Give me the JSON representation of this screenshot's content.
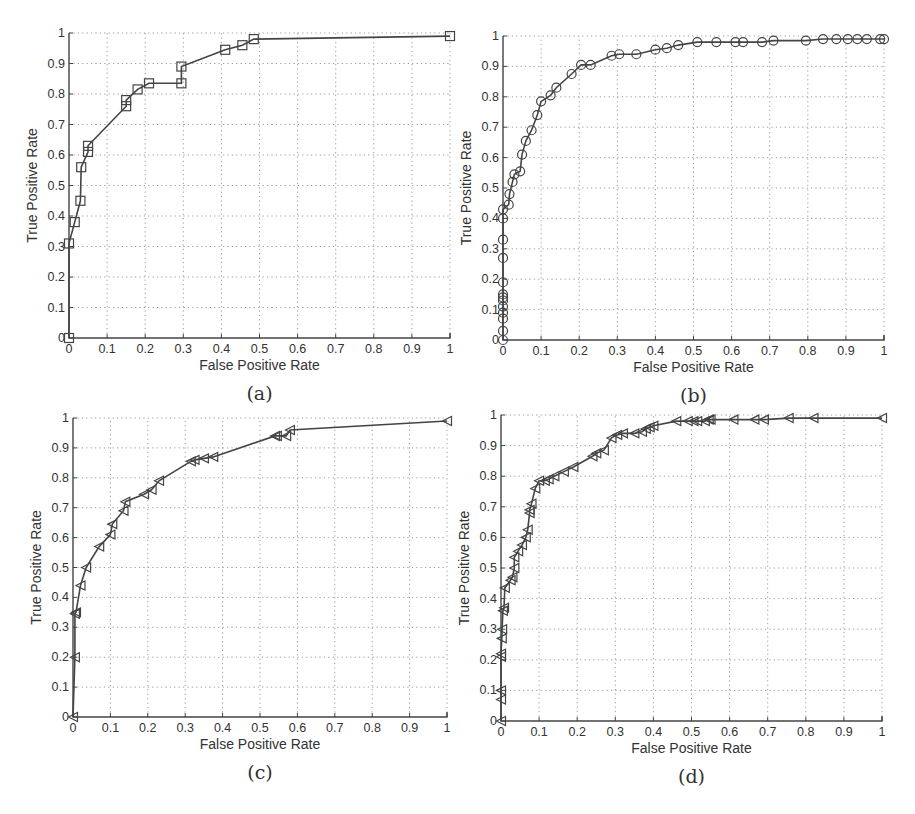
{
  "figure": {
    "panels": [
      {
        "id": "a",
        "caption": "(a)",
        "marker": "square"
      },
      {
        "id": "b",
        "caption": "(b)",
        "marker": "circle"
      },
      {
        "id": "c",
        "caption": "(c)",
        "marker": "triangle-left"
      },
      {
        "id": "d",
        "caption": "(d)",
        "marker": "triangle-left"
      }
    ],
    "xlabel": "False Positive Rate",
    "ylabel": "True Positive Rate",
    "xticks": [
      "0",
      "0.1",
      "0.2",
      "0.3",
      "0.4",
      "0.5",
      "0.6",
      "0.7",
      "0.8",
      "0.9",
      "1"
    ],
    "yticks": [
      "0",
      "0.1",
      "0.2",
      "0.3",
      "0.4",
      "0.5",
      "0.6",
      "0.7",
      "0.8",
      "0.9",
      "1"
    ],
    "line_color": "#444444",
    "grid_color": "#9a9a9a"
  },
  "chart_data": [
    {
      "type": "line",
      "panel": "(a)",
      "title": "",
      "xlabel": "False Positive Rate",
      "ylabel": "True Positive Rate",
      "xlim": [
        0,
        1
      ],
      "ylim": [
        0,
        1
      ],
      "grid": true,
      "marker": "square",
      "x": [
        0,
        0,
        0.015,
        0.03,
        0.032,
        0.05,
        0.05,
        0.15,
        0.15,
        0.18,
        0.21,
        0.295,
        0.295,
        0.41,
        0.455,
        0.485,
        1.0
      ],
      "y": [
        0,
        0.31,
        0.38,
        0.45,
        0.56,
        0.61,
        0.63,
        0.76,
        0.78,
        0.815,
        0.835,
        0.835,
        0.89,
        0.945,
        0.96,
        0.98,
        0.99
      ]
    },
    {
      "type": "line",
      "panel": "(b)",
      "title": "",
      "xlabel": "False Positive Rate",
      "ylabel": "True Positive Rate",
      "xlim": [
        0,
        1
      ],
      "ylim": [
        0,
        1
      ],
      "grid": true,
      "marker": "circle",
      "x": [
        0,
        0,
        0,
        0,
        0,
        0,
        0,
        0,
        0,
        0,
        0,
        0,
        0,
        0.015,
        0.017,
        0.025,
        0.03,
        0.045,
        0.05,
        0.06,
        0.075,
        0.09,
        0.1,
        0.125,
        0.14,
        0.18,
        0.205,
        0.23,
        0.285,
        0.305,
        0.35,
        0.4,
        0.43,
        0.46,
        0.51,
        0.56,
        0.61,
        0.63,
        0.68,
        0.71,
        0.795,
        0.84,
        0.875,
        0.905,
        0.93,
        0.955,
        0.99,
        1.0
      ],
      "y": [
        0,
        0.03,
        0.07,
        0.09,
        0.11,
        0.13,
        0.14,
        0.15,
        0.19,
        0.27,
        0.33,
        0.4,
        0.43,
        0.445,
        0.48,
        0.52,
        0.545,
        0.555,
        0.61,
        0.655,
        0.69,
        0.74,
        0.785,
        0.805,
        0.83,
        0.875,
        0.905,
        0.905,
        0.935,
        0.94,
        0.94,
        0.955,
        0.96,
        0.97,
        0.98,
        0.98,
        0.98,
        0.98,
        0.98,
        0.985,
        0.985,
        0.99,
        0.99,
        0.99,
        0.99,
        0.99,
        0.99,
        0.99
      ]
    },
    {
      "type": "line",
      "panel": "(c)",
      "title": "",
      "xlabel": "False Positive Rate",
      "ylabel": "True Positive Rate",
      "xlim": [
        0,
        1
      ],
      "ylim": [
        0,
        1
      ],
      "grid": true,
      "marker": "triangle-left",
      "x": [
        0,
        0.005,
        0.005,
        0.008,
        0.02,
        0.035,
        0.07,
        0.1,
        0.105,
        0.135,
        0.14,
        0.19,
        0.21,
        0.23,
        0.315,
        0.325,
        0.35,
        0.375,
        0.54,
        0.545,
        0.57,
        0.58,
        1.0
      ],
      "y": [
        0,
        0.2,
        0.345,
        0.35,
        0.44,
        0.5,
        0.57,
        0.61,
        0.645,
        0.69,
        0.72,
        0.745,
        0.76,
        0.79,
        0.855,
        0.86,
        0.865,
        0.87,
        0.94,
        0.94,
        0.94,
        0.96,
        0.99
      ]
    },
    {
      "type": "line",
      "panel": "(d)",
      "title": "",
      "xlabel": "False Positive Rate",
      "ylabel": "True Positive Rate",
      "xlim": [
        0,
        1
      ],
      "ylim": [
        0,
        1
      ],
      "grid": true,
      "marker": "triangle-left",
      "x": [
        0,
        0,
        0,
        0,
        0,
        0.002,
        0.003,
        0.005,
        0.008,
        0.01,
        0.025,
        0.03,
        0.035,
        0.035,
        0.045,
        0.055,
        0.065,
        0.07,
        0.075,
        0.075,
        0.08,
        0.09,
        0.1,
        0.115,
        0.125,
        0.14,
        0.165,
        0.19,
        0.24,
        0.25,
        0.27,
        0.29,
        0.305,
        0.32,
        0.35,
        0.37,
        0.38,
        0.39,
        0.4,
        0.46,
        0.49,
        0.505,
        0.515,
        0.535,
        0.545,
        0.55,
        0.61,
        0.665,
        0.69,
        0.755,
        0.82,
        1.0
      ],
      "y": [
        0,
        0.07,
        0.1,
        0.21,
        0.22,
        0.27,
        0.3,
        0.36,
        0.37,
        0.435,
        0.46,
        0.47,
        0.5,
        0.535,
        0.555,
        0.575,
        0.6,
        0.625,
        0.68,
        0.69,
        0.71,
        0.76,
        0.785,
        0.785,
        0.79,
        0.8,
        0.815,
        0.83,
        0.865,
        0.875,
        0.885,
        0.925,
        0.935,
        0.94,
        0.94,
        0.945,
        0.955,
        0.96,
        0.965,
        0.98,
        0.98,
        0.98,
        0.98,
        0.98,
        0.985,
        0.985,
        0.985,
        0.985,
        0.985,
        0.99,
        0.99,
        0.99
      ]
    }
  ]
}
